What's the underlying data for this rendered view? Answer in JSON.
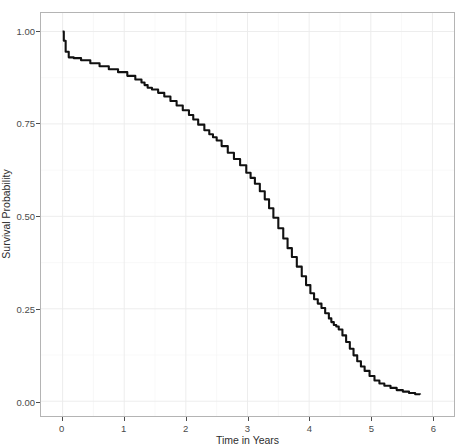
{
  "chart_data": {
    "type": "line",
    "subtype": "kaplan-meier-survival-curve",
    "title": "",
    "xlabel": "Time in Years",
    "ylabel": "Survival Probability",
    "xlim": [
      -0.35,
      6.35
    ],
    "ylim": [
      -0.04,
      1.05
    ],
    "grid": true,
    "legend": null,
    "x_ticks": [
      0,
      1,
      2,
      3,
      4,
      5,
      6
    ],
    "x_tick_labels": [
      "0",
      "1",
      "2",
      "3",
      "4",
      "5",
      "6"
    ],
    "y_ticks": [
      0.0,
      0.25,
      0.5,
      0.75,
      1.0
    ],
    "y_tick_labels": [
      "0.00",
      "0.25",
      "0.50",
      "0.75",
      "1.00"
    ],
    "line_color": "#111111",
    "panel_border_color": "#b4b4b4",
    "grid_color": "#ebebeb",
    "background_color": "#ffffff",
    "series": [
      {
        "name": "survival",
        "x": [
          0.0,
          0.02,
          0.05,
          0.1,
          0.18,
          0.3,
          0.45,
          0.6,
          0.75,
          0.9,
          1.05,
          1.18,
          1.28,
          1.33,
          1.38,
          1.45,
          1.55,
          1.65,
          1.75,
          1.85,
          1.95,
          2.05,
          2.12,
          2.2,
          2.3,
          2.38,
          2.44,
          2.5,
          2.58,
          2.68,
          2.78,
          2.88,
          2.98,
          3.05,
          3.12,
          3.2,
          3.28,
          3.35,
          3.42,
          3.5,
          3.58,
          3.65,
          3.72,
          3.8,
          3.88,
          3.95,
          4.02,
          4.08,
          4.14,
          4.2,
          4.26,
          4.32,
          4.36,
          4.4,
          4.44,
          4.48,
          4.54,
          4.6,
          4.66,
          4.72,
          4.78,
          4.84,
          4.9,
          4.98,
          5.06,
          5.14,
          5.22,
          5.32,
          5.42,
          5.52,
          5.62,
          5.72,
          5.8
        ],
        "y": [
          1.0,
          0.975,
          0.945,
          0.93,
          0.928,
          0.922,
          0.914,
          0.906,
          0.898,
          0.89,
          0.88,
          0.87,
          0.862,
          0.855,
          0.848,
          0.843,
          0.834,
          0.824,
          0.812,
          0.8,
          0.787,
          0.774,
          0.762,
          0.748,
          0.733,
          0.722,
          0.714,
          0.705,
          0.69,
          0.672,
          0.655,
          0.638,
          0.618,
          0.604,
          0.588,
          0.568,
          0.546,
          0.522,
          0.496,
          0.468,
          0.44,
          0.414,
          0.39,
          0.364,
          0.338,
          0.314,
          0.292,
          0.276,
          0.264,
          0.252,
          0.238,
          0.224,
          0.214,
          0.206,
          0.202,
          0.194,
          0.178,
          0.16,
          0.142,
          0.124,
          0.108,
          0.094,
          0.082,
          0.068,
          0.056,
          0.048,
          0.042,
          0.036,
          0.03,
          0.026,
          0.022,
          0.019,
          0.018
        ]
      }
    ]
  },
  "axes": {
    "x_title": "Time in Years",
    "y_title": "Survival Probability"
  }
}
